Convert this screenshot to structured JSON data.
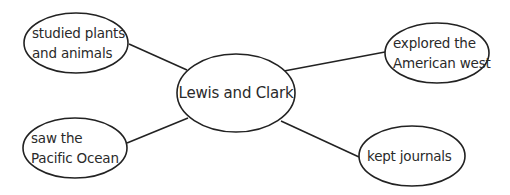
{
  "diagram": {
    "type": "concept-web",
    "stroke_color": "#222222",
    "background": "#ffffff",
    "center": {
      "label": "Lewis and Clark",
      "cx": 236,
      "cy": 93,
      "rx": 59,
      "ry": 39
    },
    "nodes": [
      {
        "id": "top-left",
        "lines": [
          "studied plants",
          "and animals"
        ],
        "cx": 76,
        "cy": 43,
        "rx": 52,
        "ry": 30,
        "edge": {
          "x1": 129,
          "y1": 44,
          "x2": 187,
          "y2": 70
        }
      },
      {
        "id": "top-right",
        "lines": [
          "explored the",
          "American west"
        ],
        "cx": 437,
        "cy": 53,
        "rx": 52,
        "ry": 30,
        "edge": {
          "x1": 385,
          "y1": 52,
          "x2": 284,
          "y2": 71
        }
      },
      {
        "id": "bottom-left",
        "lines": [
          "saw the",
          "Pacific Ocean"
        ],
        "cx": 75,
        "cy": 148,
        "rx": 52,
        "ry": 30,
        "edge": {
          "x1": 127,
          "y1": 143,
          "x2": 188,
          "y2": 118
        }
      },
      {
        "id": "bottom-right",
        "lines": [
          "kept journals"
        ],
        "cx": 412,
        "cy": 156,
        "rx": 53,
        "ry": 30,
        "edge": {
          "x1": 281,
          "y1": 121,
          "x2": 359,
          "y2": 157
        }
      }
    ]
  }
}
